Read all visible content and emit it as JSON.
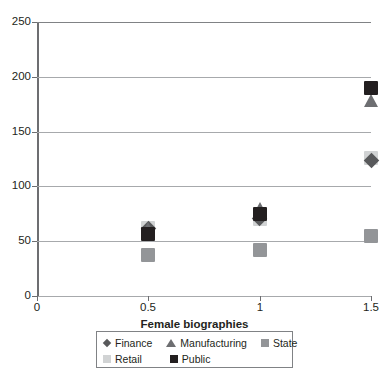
{
  "chart_data": {
    "type": "scatter",
    "title": "",
    "xlabel": "Female biographies",
    "ylabel": "",
    "xlim": [
      0,
      1.5
    ],
    "ylim": [
      0,
      250
    ],
    "x_ticks": [
      "0",
      "0.5",
      "1",
      "1.5"
    ],
    "x_tick_values": [
      0,
      0.5,
      1,
      1.5
    ],
    "y_ticks": [
      "0",
      "50",
      "100",
      "150",
      "200",
      "250"
    ],
    "y_tick_values": [
      0,
      50,
      100,
      150,
      200,
      250
    ],
    "grid": "horizontal",
    "legend_position": "bottom",
    "series": [
      {
        "name": "Finance",
        "marker": "diamond",
        "color": "#58595b",
        "points": [
          {
            "x": 0.5,
            "y": 62
          },
          {
            "x": 1.0,
            "y": 71
          },
          {
            "x": 1.5,
            "y": 124
          }
        ]
      },
      {
        "name": "Manufacturing",
        "marker": "triangle",
        "color": "#6d6e71",
        "points": [
          {
            "x": 0.5,
            "y": 62
          },
          {
            "x": 1.0,
            "y": 80
          },
          {
            "x": 1.5,
            "y": 178
          }
        ]
      },
      {
        "name": "State",
        "marker": "square",
        "color": "#939598",
        "points": [
          {
            "x": 0.5,
            "y": 37
          },
          {
            "x": 1.0,
            "y": 42
          },
          {
            "x": 1.5,
            "y": 55
          }
        ]
      },
      {
        "name": "Retail",
        "marker": "square",
        "color": "#d1d3d4",
        "points": [
          {
            "x": 0.5,
            "y": 62
          },
          {
            "x": 1.0,
            "y": 70
          },
          {
            "x": 1.5,
            "y": 126
          }
        ]
      },
      {
        "name": "Public",
        "marker": "square",
        "color": "#231f20",
        "points": [
          {
            "x": 0.5,
            "y": 57
          },
          {
            "x": 1.0,
            "y": 75
          },
          {
            "x": 1.5,
            "y": 190
          }
        ]
      }
    ]
  },
  "legend": {
    "rows": [
      [
        {
          "label": "Finance",
          "marker": "diamond",
          "color": "#58595b"
        },
        {
          "label": "Manufacturing",
          "marker": "triangle",
          "color": "#6d6e71"
        },
        {
          "label": "State",
          "marker": "square",
          "color": "#939598"
        }
      ],
      [
        {
          "label": "Retail",
          "marker": "square",
          "color": "#d1d3d4"
        },
        {
          "label": "Public",
          "marker": "square",
          "color": "#231f20"
        }
      ]
    ]
  },
  "colors": {
    "axis": "#6d6e71",
    "grid": "#a7a9ac",
    "text": "#231f20",
    "background": "#ffffff"
  }
}
